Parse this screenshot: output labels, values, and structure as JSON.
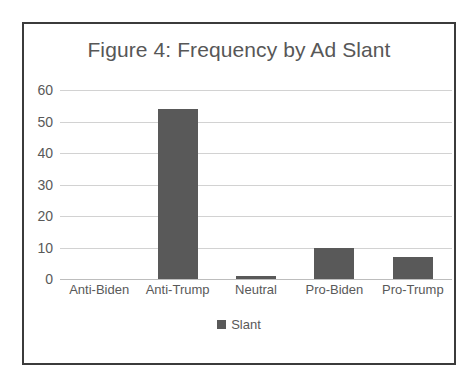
{
  "chart_data": {
    "type": "bar",
    "title": "Figure 4: Frequency by Ad Slant",
    "xlabel": "",
    "ylabel": "",
    "categories": [
      "Anti-Biden",
      "Anti-Trump",
      "Neutral",
      "Pro-Biden",
      "Pro-Trump"
    ],
    "values": [
      0,
      54,
      1,
      10,
      7
    ],
    "series": [
      {
        "name": "Slant",
        "values": [
          0,
          54,
          1,
          10,
          7
        ]
      }
    ],
    "ylim": [
      0,
      60
    ],
    "yticks": [
      0,
      10,
      20,
      30,
      40,
      50,
      60
    ],
    "ytick_labels": [
      "0",
      "10",
      "20",
      "30",
      "40",
      "50",
      "60"
    ],
    "grid": true,
    "legend": {
      "position": "bottom",
      "entries": [
        "Slant"
      ]
    },
    "colors": {
      "bar": "#595959",
      "gridline": "#d2d2d2",
      "text": "#595959",
      "frame_border": "#3b3b3b",
      "background": "#ffffff"
    }
  },
  "figure": {
    "border_color": "#3b3b3b"
  }
}
